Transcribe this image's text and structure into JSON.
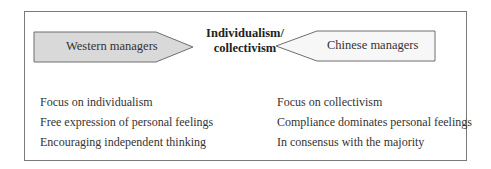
{
  "diagram": {
    "center_title_line1": "Individualism/",
    "center_title_line2": "collectivism",
    "left_arrow": {
      "label": "Western managers",
      "fill": "#d9d9d9",
      "direction": "right"
    },
    "right_arrow": {
      "label": "Chinese managers",
      "fill": "#f7f7f7",
      "direction": "left"
    },
    "western_traits": [
      "Focus on individualism",
      "Free expression of personal feelings",
      "Encouraging independent thinking"
    ],
    "chinese_traits": [
      "Focus on collectivism",
      "Compliance dominates personal feelings",
      "In consensus with the majority"
    ]
  }
}
